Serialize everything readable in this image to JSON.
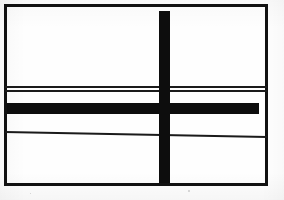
{
  "figure": {
    "background_color": "#fefefe",
    "ink_color": "#0d0d0d",
    "canvas": {
      "width": 284,
      "height": 200
    }
  },
  "frame": {
    "label": "outer rectangle border",
    "x": 4,
    "y": 4,
    "width": 264,
    "height": 182,
    "stroke_width": 3,
    "color": "#111111"
  },
  "shapes": [
    {
      "name": "vertical-bar",
      "label": "thick vertical bar",
      "orientation": "vertical",
      "x": 159,
      "y": 11,
      "width": 11,
      "height": 172,
      "color": "#0d0d0d"
    },
    {
      "name": "horizontal-bar",
      "label": "thick horizontal bar",
      "orientation": "horizontal",
      "x": 7,
      "y": 103,
      "width": 252,
      "height": 11,
      "color": "#0d0d0d"
    }
  ],
  "rules": [
    {
      "name": "upper-rule-1",
      "label": "upper thin rule line",
      "x": 5,
      "y_left": 86,
      "y_right": 86,
      "length": 262,
      "thickness": 1.5,
      "color": "#1a1a1a"
    },
    {
      "name": "upper-rule-2",
      "label": "second thin rule line",
      "x": 5,
      "y_left": 90,
      "y_right": 90,
      "length": 262,
      "thickness": 1.5,
      "color": "#1a1a1a"
    },
    {
      "name": "lower-rule",
      "label": "lower slanted thin rule line",
      "x": 5,
      "y_left": 131,
      "y_right": 136,
      "length": 262,
      "thickness": 1.5,
      "color": "#1a1a1a"
    }
  ],
  "specks": [
    {
      "name": "scan-speck-1",
      "x": 188,
      "y": 190,
      "size": 2
    },
    {
      "name": "scan-speck-2",
      "x": 30,
      "y": 193,
      "size": 1
    }
  ]
}
